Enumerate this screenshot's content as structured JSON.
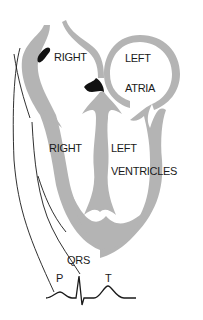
{
  "diagram": {
    "type": "heart-conduction-ecg",
    "labels": {
      "right_atrium": "RIGHT",
      "left_atrium_1": "LEFT",
      "left_atrium_2": "ATRIA",
      "right_ventricle": "RIGHT",
      "left_ventricle_1": "LEFT",
      "left_ventricle_2": "VENTRICLES",
      "qrs": "QRS",
      "p_wave": "P",
      "t_wave": "T"
    },
    "colors": {
      "wall": "#b4b4b4",
      "line": "#1a1a1a",
      "node": "#111111",
      "background": "#ffffff"
    },
    "nodes": [
      {
        "name": "sinoatrial-node"
      },
      {
        "name": "atrioventricular-node"
      }
    ],
    "ecg_waves": [
      "P",
      "QRS",
      "T"
    ]
  }
}
